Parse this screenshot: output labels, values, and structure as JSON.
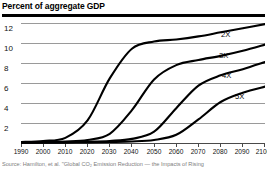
{
  "title": "Percent of aggregate GDP",
  "source_note": "Source: Hamilton, et al. \"Global CO₂ Emission Reduction — the Impacts of Rising",
  "chart_data": {
    "type": "line",
    "title": "Percent of aggregate GDP",
    "xlabel": "",
    "ylabel": "Percent of aggregate GDP",
    "xlim": [
      1990,
      2100
    ],
    "ylim": [
      0,
      12
    ],
    "grid": true,
    "legend_position": "inline-right",
    "xticks": [
      1990,
      2000,
      2010,
      2020,
      2030,
      2040,
      2050,
      2060,
      2070,
      2080,
      2090,
      2100
    ],
    "yticks": [
      2,
      4,
      6,
      8,
      10,
      12
    ],
    "x": [
      1990,
      2000,
      2010,
      2020,
      2030,
      2040,
      2050,
      2060,
      2070,
      2080,
      2090,
      2100
    ],
    "series": [
      {
        "name": "2X",
        "label": "2X",
        "values": [
          0.1,
          0.2,
          0.5,
          2.2,
          6.3,
          9.2,
          9.9,
          10.1,
          10.4,
          10.8,
          11.2,
          11.6
        ]
      },
      {
        "name": "3X",
        "label": "3X",
        "values": [
          0.05,
          0.1,
          0.15,
          0.3,
          0.9,
          3.2,
          6.2,
          7.6,
          8.1,
          8.5,
          9.0,
          9.6
        ]
      },
      {
        "name": "4X",
        "label": "4X",
        "values": [
          0.03,
          0.05,
          0.08,
          0.12,
          0.2,
          0.4,
          1.1,
          3.4,
          5.6,
          6.6,
          7.2,
          7.9
        ]
      },
      {
        "name": "5X",
        "label": "5X",
        "values": [
          0.02,
          0.03,
          0.04,
          0.06,
          0.1,
          0.15,
          0.3,
          0.8,
          2.3,
          4.0,
          4.9,
          5.5
        ]
      }
    ]
  },
  "series_labels": [
    {
      "text": "2X",
      "left": 221,
      "top": 30
    },
    {
      "text": "3X",
      "left": 219,
      "top": 51
    },
    {
      "text": "4X",
      "left": 222,
      "top": 71
    },
    {
      "text": "5X",
      "left": 235,
      "top": 92
    }
  ]
}
